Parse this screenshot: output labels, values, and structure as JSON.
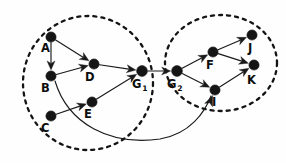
{
  "figure": {
    "type": "directed-graph",
    "background_color": "#fefefe",
    "ink_color": "#151515",
    "width": 286,
    "height": 163
  },
  "nodes": [
    {
      "id": "A",
      "label": "A",
      "sub": "",
      "x": 51,
      "y": 37,
      "r": 5.1,
      "label_x": 41,
      "label_y": 52,
      "cluster": "G1"
    },
    {
      "id": "B",
      "label": "B",
      "sub": "",
      "x": 51,
      "y": 76,
      "r": 5.1,
      "label_x": 41,
      "label_y": 92,
      "cluster": "G1"
    },
    {
      "id": "C",
      "label": "C",
      "sub": "",
      "x": 51,
      "y": 116,
      "r": 5.1,
      "label_x": 41,
      "label_y": 132,
      "cluster": "G1"
    },
    {
      "id": "D",
      "label": "D",
      "sub": "",
      "x": 94,
      "y": 64,
      "r": 5.1,
      "label_x": 85,
      "label_y": 81,
      "cluster": "G1"
    },
    {
      "id": "E",
      "label": "E",
      "sub": "",
      "x": 92,
      "y": 102,
      "r": 5.1,
      "label_x": 84,
      "label_y": 118,
      "cluster": "G1"
    },
    {
      "id": "G1",
      "label": "G",
      "sub": "1",
      "x": 142,
      "y": 71,
      "r": 5.4,
      "label_x": 132,
      "label_y": 88,
      "cluster": "G1"
    },
    {
      "id": "G2",
      "label": "G",
      "sub": "2",
      "x": 177,
      "y": 71,
      "r": 5.4,
      "label_x": 167,
      "label_y": 88,
      "cluster": "G2"
    },
    {
      "id": "F",
      "label": "F",
      "sub": "",
      "x": 213,
      "y": 52,
      "r": 5.1,
      "label_x": 206,
      "label_y": 69,
      "cluster": "G2"
    },
    {
      "id": "I",
      "label": "I",
      "sub": "",
      "x": 215,
      "y": 90,
      "r": 5.1,
      "label_x": 212,
      "label_y": 106,
      "cluster": "G2"
    },
    {
      "id": "J",
      "label": "J",
      "sub": "",
      "x": 252,
      "y": 35,
      "r": 5.1,
      "label_x": 248,
      "label_y": 52,
      "cluster": "G2"
    },
    {
      "id": "K",
      "label": "K",
      "sub": "",
      "x": 254,
      "y": 65,
      "r": 5.1,
      "label_x": 247,
      "label_y": 84,
      "cluster": "G2"
    }
  ],
  "edges": [
    {
      "id": "A-B",
      "from": "A",
      "to": "B",
      "shape": "line",
      "arrow": true
    },
    {
      "id": "A-D",
      "from": "A",
      "to": "D",
      "shape": "line",
      "arrow": true
    },
    {
      "id": "B-D",
      "from": "B",
      "to": "D",
      "shape": "line",
      "arrow": true
    },
    {
      "id": "C-E",
      "from": "C",
      "to": "E",
      "shape": "line",
      "arrow": true
    },
    {
      "id": "D-G1",
      "from": "D",
      "to": "G1",
      "shape": "line",
      "arrow": true
    },
    {
      "id": "E-G1",
      "from": "E",
      "to": "G1",
      "shape": "line",
      "arrow": true
    },
    {
      "id": "G1-G2",
      "from": "G1",
      "to": "G2",
      "shape": "line",
      "arrow": true
    },
    {
      "id": "G2-F",
      "from": "G2",
      "to": "F",
      "shape": "line",
      "arrow": true
    },
    {
      "id": "G2-I",
      "from": "G2",
      "to": "I",
      "shape": "line",
      "arrow": true
    },
    {
      "id": "F-J",
      "from": "F",
      "to": "J",
      "shape": "line",
      "arrow": true
    },
    {
      "id": "F-K",
      "from": "F",
      "to": "K",
      "shape": "line",
      "arrow": true
    },
    {
      "id": "I-K",
      "from": "I",
      "to": "K",
      "shape": "line",
      "arrow": true
    },
    {
      "id": "B-I",
      "from": "B",
      "to": "I",
      "shape": "curve",
      "arrow": true,
      "path": "M 55 81 C 68 124, 110 146, 160 139 C 190 134, 205 112, 211 96"
    }
  ],
  "clusters": [
    {
      "id": "G1",
      "name": "left-cluster",
      "cx": 88,
      "cy": 83,
      "rx": 65,
      "ry": 67
    },
    {
      "id": "G2",
      "name": "right-cluster",
      "cx": 221,
      "cy": 63,
      "rx": 56,
      "ry": 48
    }
  ]
}
